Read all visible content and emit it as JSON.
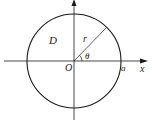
{
  "diagram": {
    "type": "polar-region-circle",
    "labels": {
      "region": "D",
      "radius": "r",
      "angle": "θ",
      "origin": "O",
      "intercept": "a",
      "x_axis": "x",
      "y_axis": "y"
    },
    "colors": {
      "stroke": "#1a1a1a",
      "background": "#ffffff"
    }
  }
}
